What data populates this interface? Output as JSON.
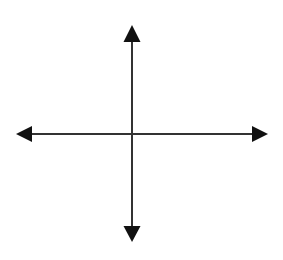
{
  "diagram": {
    "type": "coordinate-axes",
    "colors": {
      "background": "#ffffff",
      "line": "#333333",
      "arrowhead": "#111111"
    },
    "origin": {
      "x": 132,
      "y": 134
    },
    "axes": [
      {
        "name": "horizontal",
        "from": {
          "x": 16,
          "y": 134
        },
        "to": {
          "x": 268,
          "y": 134
        },
        "arrows": [
          "left",
          "right"
        ]
      },
      {
        "name": "vertical",
        "from": {
          "x": 132,
          "y": 25
        },
        "to": {
          "x": 132,
          "y": 242
        },
        "arrows": [
          "up",
          "down"
        ]
      }
    ],
    "labels": []
  }
}
